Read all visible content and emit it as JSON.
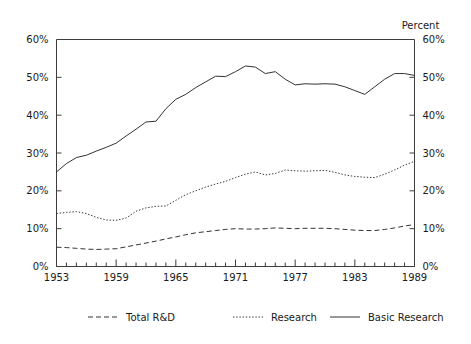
{
  "chart_data": {
    "type": "line",
    "title": "",
    "subtitle": "",
    "xlabel": "",
    "ylabel": "Percent",
    "y_axis_title": "Percent",
    "xlim": [
      1953,
      1989
    ],
    "ylim": [
      0,
      60
    ],
    "grid": false,
    "legend_position": "bottom",
    "y_ticks": [
      0,
      10,
      20,
      30,
      40,
      50,
      60
    ],
    "y_ticklabels": [
      "0%",
      "10%",
      "20%",
      "30%",
      "40%",
      "50%",
      "60%"
    ],
    "y_ticklabels_right": [
      "0%",
      "10%",
      "20%",
      "30%",
      "40%",
      "50%",
      "60%"
    ],
    "x_ticks": [
      1953,
      1954,
      1955,
      1956,
      1957,
      1958,
      1959,
      1960,
      1961,
      1962,
      1963,
      1964,
      1965,
      1966,
      1967,
      1968,
      1969,
      1970,
      1971,
      1972,
      1973,
      1974,
      1975,
      1976,
      1977,
      1978,
      1979,
      1980,
      1981,
      1982,
      1983,
      1984,
      1985,
      1986,
      1987,
      1988,
      1989
    ],
    "x_ticklabels": [
      "1953",
      "1959",
      "1965",
      "1971",
      "1977",
      "1983",
      "1989"
    ],
    "x_labeled_ticks": [
      1953,
      1959,
      1965,
      1971,
      1977,
      1983,
      1989
    ],
    "x": [
      1953,
      1954,
      1955,
      1956,
      1957,
      1958,
      1959,
      1960,
      1961,
      1962,
      1963,
      1964,
      1965,
      1966,
      1967,
      1968,
      1969,
      1970,
      1971,
      1972,
      1973,
      1974,
      1975,
      1976,
      1977,
      1978,
      1979,
      1980,
      1981,
      1982,
      1983,
      1984,
      1985,
      1986,
      1987,
      1988,
      1989
    ],
    "series": [
      {
        "name": "Total R&D",
        "style": "dashed",
        "color": "#333333",
        "values": [
          5.1,
          5.0,
          4.8,
          4.6,
          4.5,
          4.6,
          4.7,
          5.2,
          5.7,
          6.2,
          6.7,
          7.3,
          7.8,
          8.4,
          8.9,
          9.2,
          9.5,
          9.8,
          10.0,
          9.9,
          9.9,
          10.0,
          10.2,
          10.1,
          10.0,
          10.1,
          10.1,
          10.1,
          10.0,
          9.8,
          9.6,
          9.5,
          9.5,
          9.8,
          10.2,
          10.7,
          11.1
        ]
      },
      {
        "name": "Research",
        "style": "dotted",
        "color": "#333333",
        "values": [
          14.0,
          14.3,
          14.5,
          14.0,
          13.0,
          12.3,
          12.2,
          12.8,
          14.6,
          15.5,
          15.9,
          16.0,
          17.5,
          19.0,
          20.0,
          21.0,
          21.8,
          22.5,
          23.5,
          24.4,
          25.0,
          24.2,
          24.6,
          25.5,
          25.3,
          25.2,
          25.3,
          25.4,
          24.9,
          24.2,
          23.8,
          23.6,
          23.5,
          24.4,
          25.5,
          26.8,
          27.8
        ]
      },
      {
        "name": "Basic Research",
        "style": "solid",
        "color": "#333333",
        "values": [
          25.0,
          27.2,
          28.8,
          29.4,
          30.5,
          31.5,
          32.6,
          34.5,
          36.3,
          38.2,
          38.4,
          41.7,
          44.2,
          45.5,
          47.3,
          48.8,
          50.3,
          50.2,
          51.5,
          53.0,
          52.7,
          51.0,
          51.5,
          49.5,
          48.0,
          48.3,
          48.2,
          48.3,
          48.2,
          47.5,
          46.5,
          45.5,
          47.5,
          49.5,
          51.0,
          51.0,
          50.5
        ]
      }
    ]
  },
  "legend": {
    "items": [
      {
        "label": "Total R&D",
        "style": "dashed"
      },
      {
        "label": "Research",
        "style": "dotted"
      },
      {
        "label": "Basic Research",
        "style": "solid"
      }
    ]
  }
}
